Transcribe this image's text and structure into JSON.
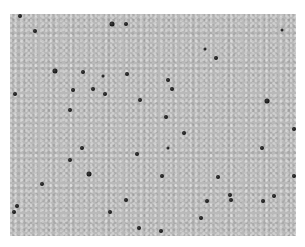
{
  "image": {
    "description": "Grayscale micrograph of tissue with scattered dark-stained nuclei",
    "background_color": "#b9b9b9",
    "nucleus_color": "#1a1a1a",
    "frame": {
      "x": 10,
      "y": 14,
      "width": 286,
      "height": 222
    }
  },
  "nuclei": [
    [
      20,
      16,
      4
    ],
    [
      35,
      31,
      4
    ],
    [
      112,
      24,
      5
    ],
    [
      126,
      24,
      4
    ],
    [
      55,
      71,
      5
    ],
    [
      83,
      72,
      4
    ],
    [
      103,
      76,
      3
    ],
    [
      127,
      74,
      4
    ],
    [
      15,
      94,
      4
    ],
    [
      73,
      90,
      4
    ],
    [
      93,
      89,
      4
    ],
    [
      105,
      94,
      4
    ],
    [
      140,
      100,
      4
    ],
    [
      70,
      110,
      4
    ],
    [
      282,
      30,
      3
    ],
    [
      205,
      49,
      3
    ],
    [
      216,
      58,
      4
    ],
    [
      168,
      80,
      4
    ],
    [
      172,
      89,
      4
    ],
    [
      267,
      101,
      5
    ],
    [
      166,
      117,
      4
    ],
    [
      82,
      148,
      4
    ],
    [
      70,
      160,
      4
    ],
    [
      89,
      174,
      5
    ],
    [
      42,
      184,
      4
    ],
    [
      137,
      154,
      4
    ],
    [
      126,
      200,
      4
    ],
    [
      110,
      212,
      4
    ],
    [
      17,
      206,
      4
    ],
    [
      14,
      212,
      4
    ],
    [
      139,
      228,
      4
    ],
    [
      184,
      133,
      4
    ],
    [
      168,
      148,
      3
    ],
    [
      262,
      148,
      4
    ],
    [
      294,
      129,
      4
    ],
    [
      162,
      176,
      4
    ],
    [
      218,
      177,
      4
    ],
    [
      294,
      176,
      4
    ],
    [
      230,
      195,
      4
    ],
    [
      231,
      200,
      4
    ],
    [
      207,
      201,
      4
    ],
    [
      263,
      201,
      4
    ],
    [
      274,
      196,
      4
    ],
    [
      201,
      218,
      4
    ],
    [
      161,
      231,
      4
    ]
  ]
}
